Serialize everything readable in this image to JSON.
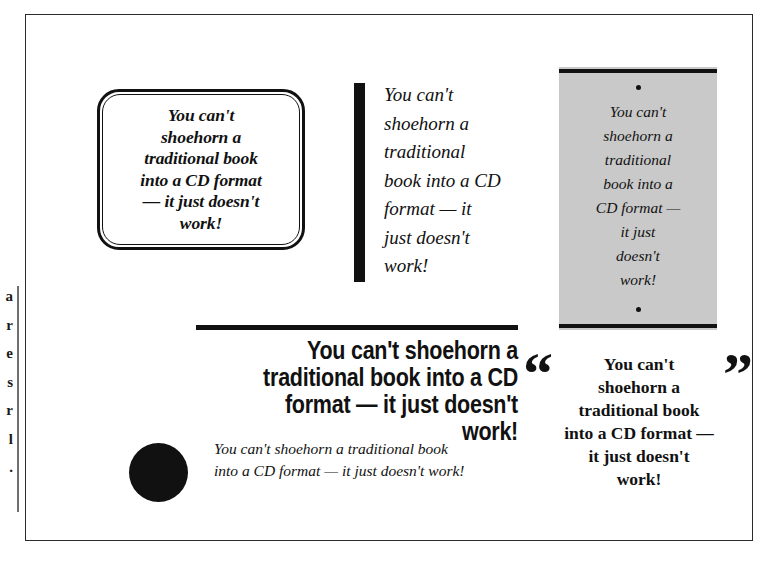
{
  "page": {
    "quote_text": "You can't shoehorn a traditional book into a CD format — it just doesn't work!",
    "frame_color": "#2b2b2b",
    "background_color": "#ffffff",
    "ink_color": "#111111"
  },
  "margin_note": {
    "visible_fragment": "a\nr\ne\ns\nr\nl\n."
  },
  "variants": {
    "rounded_box": {
      "name": "rounded-double-border-box",
      "lines": "You can't\nshoehorn a\ntraditional book\ninto a CD format\n— it just doesn't\nwork!"
    },
    "vertical_bar": {
      "name": "thick-vertical-rule",
      "lines": "You can't\nshoehorn a\ntraditional\nbook into a CD\nformat — it\njust doesn't\nwork!"
    },
    "grey_panel": {
      "name": "grey-panel-with-rules",
      "background_color": "#c9c9c9",
      "lines": "You can't\nshoehorn a\ntraditional\nbook into a\nCD format —\nit just\ndoesn't\nwork!"
    },
    "headline": {
      "name": "condensed-bold-headline",
      "lines": "You can't shoehorn a traditional book into a CD format — it just doesn't work!"
    },
    "quote_marks": {
      "name": "large-quotation-marks",
      "open_mark": "“",
      "close_mark": "”",
      "lines": "You can't\nshoehorn a\ntraditional book\ninto a CD format —\nit just doesn't\nwork!"
    },
    "circle_bullet": {
      "name": "black-circle-bullet",
      "lines": "You can't shoehorn a traditional book into a CD format — it just doesn't work!"
    }
  }
}
